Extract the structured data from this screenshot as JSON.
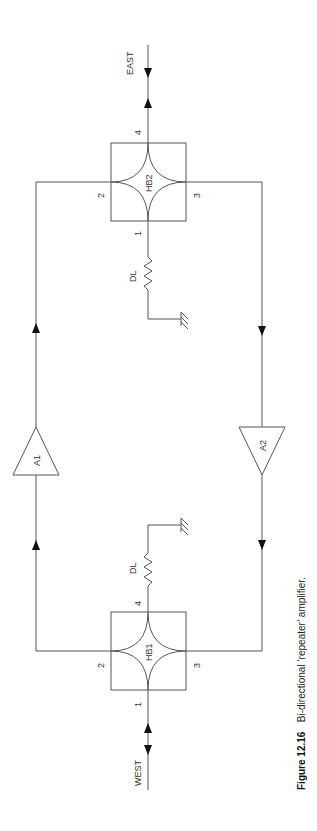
{
  "figure": {
    "number": "Figure 12.16",
    "caption": "Bi-directional ‘repeater’ amplifier."
  },
  "ports": {
    "east": "EAST",
    "west": "WEST"
  },
  "hybrids": [
    {
      "id": "HB2",
      "label": "HB2",
      "port_top": "4",
      "port_bottom": "1",
      "port_left": "2",
      "port_right": "3"
    },
    {
      "id": "HB1",
      "label": "HB1",
      "port_top": "4",
      "port_bottom": "1",
      "port_left": "2",
      "port_right": "3"
    }
  ],
  "amplifiers": [
    {
      "id": "A1",
      "label": "A1",
      "direction": "up"
    },
    {
      "id": "A2",
      "label": "A2",
      "direction": "down"
    }
  ],
  "loads": [
    {
      "id": "DL-HB2",
      "label": "DL"
    },
    {
      "id": "DL-HB1",
      "label": "DL"
    }
  ],
  "colors": {
    "line": "#555555",
    "text": "#333333",
    "background": "#ffffff"
  }
}
